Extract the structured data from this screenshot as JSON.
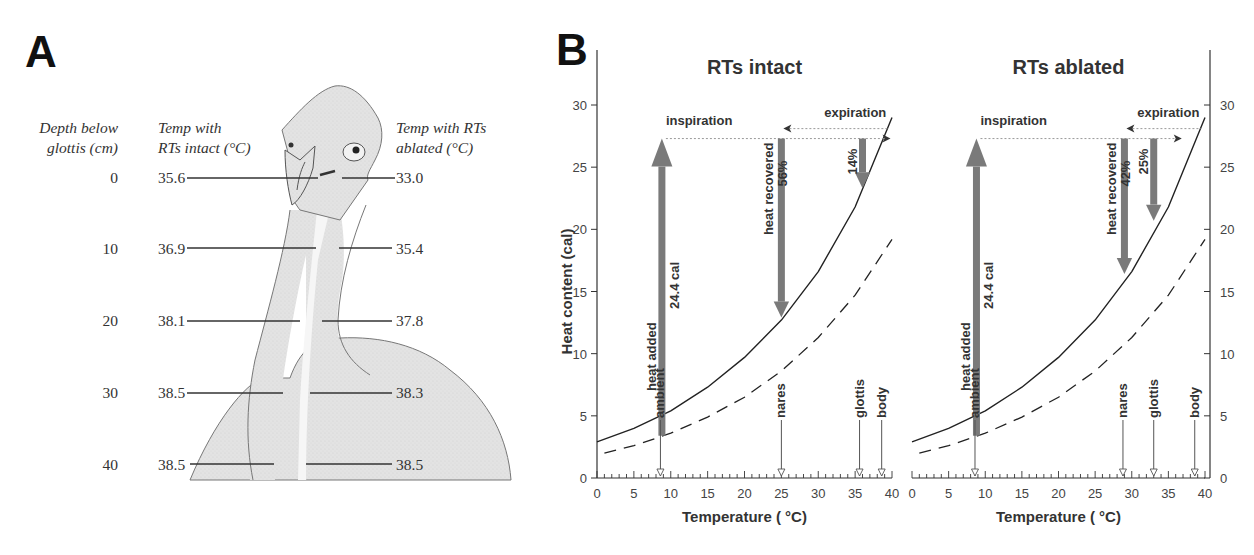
{
  "panelA": {
    "letter": "A",
    "headers": {
      "depth": [
        "Depth below",
        "glottis (cm)"
      ],
      "intact": [
        "Temp with",
        "RTs intact (°C)"
      ],
      "ablated": [
        "Temp with RTs",
        "ablated (°C)"
      ]
    },
    "rows": [
      {
        "depth": "0",
        "intact": "35.6",
        "ablated": "33.0"
      },
      {
        "depth": "10",
        "intact": "36.9",
        "ablated": "35.4"
      },
      {
        "depth": "20",
        "intact": "38.1",
        "ablated": "37.8"
      },
      {
        "depth": "30",
        "intact": "38.5",
        "ablated": "38.3"
      },
      {
        "depth": "40",
        "intact": "38.5",
        "ablated": "38.5"
      }
    ]
  },
  "panelB": {
    "letter": "B",
    "ylabel": "Heat content (cal)",
    "xlabel": "Temperature ( °C)",
    "yticks": [
      "0",
      "5",
      "10",
      "15",
      "20",
      "25",
      "30"
    ],
    "xticks": [
      "0",
      "5",
      "10",
      "15",
      "20",
      "25",
      "30",
      "35",
      "40"
    ],
    "intact": {
      "title": "RTs intact",
      "inspiration": "inspiration",
      "expiration": "expiration",
      "heat_added": "heat added",
      "heat_added_value": "24.4 cal",
      "heat_recovered": "heat recovered",
      "recovered_pct": "56%",
      "small_pct": "14%",
      "markers": [
        "ambient",
        "nares",
        "glottis",
        "body"
      ]
    },
    "ablated": {
      "title": "RTs ablated",
      "inspiration": "inspiration",
      "expiration": "expiration",
      "heat_added": "heat added",
      "heat_added_value": "24.4 cal",
      "heat_recovered": "heat recovered",
      "recovered_pct": "42%",
      "small_pct": "25%",
      "markers": [
        "ambient",
        "nares",
        "glottis",
        "body"
      ]
    }
  },
  "chart_data": [
    {
      "type": "table",
      "title": "Panel A: Tracheal air temperature vs depth below glottis",
      "columns": [
        "Depth below glottis (cm)",
        "Temp with RTs intact (°C)",
        "Temp with RTs ablated (°C)"
      ],
      "rows": [
        [
          0,
          35.6,
          33.0
        ],
        [
          10,
          36.9,
          35.4
        ],
        [
          20,
          38.1,
          37.8
        ],
        [
          30,
          38.5,
          38.3
        ],
        [
          40,
          38.5,
          38.5
        ]
      ]
    },
    {
      "type": "line",
      "title": "RTs intact",
      "xlabel": "Temperature ( °C)",
      "ylabel": "Heat content (cal)",
      "xlim": [
        0,
        40
      ],
      "ylim": [
        0,
        30
      ],
      "grid": false,
      "series": [
        {
          "name": "saturated air heat content (solid)",
          "x": [
            0,
            5,
            10,
            15,
            20,
            25,
            30,
            35,
            40
          ],
          "values": [
            2.9,
            4.0,
            5.4,
            7.3,
            9.7,
            12.7,
            16.6,
            21.8,
            29.0
          ]
        },
        {
          "name": "reference heat content (dashed)",
          "x": [
            1,
            5,
            10,
            15,
            20,
            25,
            30,
            35,
            40
          ],
          "values": [
            2.0,
            2.6,
            3.6,
            4.9,
            6.5,
            8.6,
            11.3,
            14.7,
            19.2
          ]
        }
      ],
      "markers": {
        "ambient": 8.6,
        "nares": 25.0,
        "glottis": 35.6,
        "body": 38.6
      },
      "annotations": [
        {
          "label": "heat added 24.4 cal",
          "x": 8.8,
          "from": 3.4,
          "to": 27.3
        },
        {
          "label": "heat recovered 56%",
          "x": 25.0,
          "from": 27.3,
          "to": 12.9
        },
        {
          "label": "14%",
          "x": 36.0,
          "from": 27.3,
          "to": 23.3
        },
        {
          "label": "inspiration",
          "y": 27.3
        },
        {
          "label": "expiration",
          "y": 28.1
        }
      ]
    },
    {
      "type": "line",
      "title": "RTs ablated",
      "xlabel": "Temperature ( °C)",
      "ylabel": "Heat content (cal)",
      "xlim": [
        0,
        40
      ],
      "ylim": [
        0,
        30
      ],
      "grid": false,
      "series": [
        {
          "name": "saturated air heat content (solid)",
          "x": [
            0,
            5,
            10,
            15,
            20,
            25,
            30,
            35,
            40
          ],
          "values": [
            2.9,
            4.0,
            5.4,
            7.3,
            9.7,
            12.7,
            16.6,
            21.8,
            29.0
          ]
        },
        {
          "name": "reference heat content (dashed)",
          "x": [
            1,
            5,
            10,
            15,
            20,
            25,
            30,
            35,
            40
          ],
          "values": [
            2.0,
            2.6,
            3.6,
            4.9,
            6.5,
            8.6,
            11.3,
            14.7,
            19.2
          ]
        }
      ],
      "markers": {
        "ambient": 8.6,
        "nares": 28.8,
        "glottis": 33.0,
        "body": 38.6
      },
      "annotations": [
        {
          "label": "heat added 24.4 cal",
          "x": 8.8,
          "from": 3.4,
          "to": 27.3
        },
        {
          "label": "heat recovered 42%",
          "x": 29.0,
          "from": 27.3,
          "to": 16.4
        },
        {
          "label": "25%",
          "x": 33.0,
          "from": 27.3,
          "to": 20.7
        },
        {
          "label": "inspiration",
          "y": 27.3
        },
        {
          "label": "expiration",
          "y": 28.1
        }
      ]
    }
  ]
}
